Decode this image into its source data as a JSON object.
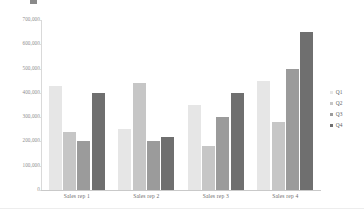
{
  "chart_data": {
    "type": "bar",
    "title": "",
    "subtitle": "",
    "xlabel": "",
    "ylabel": "",
    "categories": [
      "Sales rep 1",
      "Sales rep 2",
      "Sales rep 3",
      "Sales rep 4"
    ],
    "series": [
      {
        "name": "Q1",
        "color": "#e6e6e6",
        "values": [
          430000,
          250000,
          350000,
          450000
        ]
      },
      {
        "name": "Q2",
        "color": "#c6c6c6",
        "values": [
          240000,
          440000,
          180000,
          280000
        ]
      },
      {
        "name": "Q3",
        "color": "#9b9b9b",
        "values": [
          200000,
          200000,
          300000,
          500000
        ]
      },
      {
        "name": "Q4",
        "color": "#6f6f6f",
        "values": [
          400000,
          220000,
          400000,
          650000
        ]
      }
    ],
    "ylim": [
      0,
      700000
    ],
    "ytick_values": [
      700000,
      600000,
      500000,
      400000,
      300000,
      200000,
      100000,
      0
    ],
    "ytick_labels": [
      "700,000",
      "600,000",
      "500,000",
      "400,000",
      "300,000",
      "200,000",
      "100,000",
      "0"
    ],
    "grid": false,
    "legend_position": "right",
    "legend_entries": [
      "Q1",
      "Q2",
      "Q3",
      "Q4"
    ],
    "orientation": "vertical",
    "grouping": "clustered"
  },
  "axes": {
    "y_axis_name": "value-axis",
    "x_axis_name": "category-axis"
  }
}
